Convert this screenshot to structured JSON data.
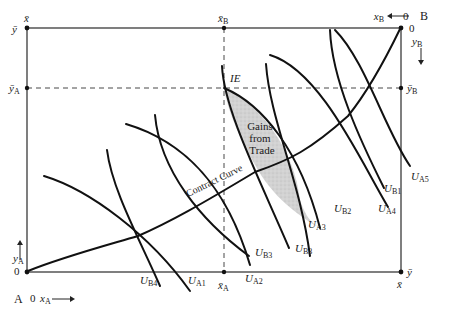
{
  "diagram": {
    "type": "Edgeworth box",
    "origin_A": {
      "label": "A",
      "zero_x": "0",
      "zero_y": "0",
      "x_axis": "x",
      "x_sub": "A",
      "y_axis": "y",
      "y_sub": "A"
    },
    "origin_B": {
      "label": "B",
      "zero_x": "0",
      "zero_y": "0",
      "x_axis": "x",
      "x_sub": "B",
      "y_axis": "y",
      "y_sub": "B"
    },
    "corner_labels": {
      "top_left_x": "x̄",
      "top_left_y": "ȳ",
      "bottom_right_x": "x̄",
      "bottom_right_y": "ȳ"
    },
    "endowment_markers": {
      "x_bar_A": {
        "base": "x̄",
        "sub": "A"
      },
      "x_bar_B": {
        "base": "x̄",
        "sub": "B"
      },
      "y_bar_A": {
        "base": "ȳ",
        "sub": "A"
      },
      "y_bar_B": {
        "base": "ȳ",
        "sub": "B"
      }
    },
    "initial_endowment_label": "IE",
    "gains_region_label": [
      "Gains",
      "from",
      "Trade"
    ],
    "contract_curve_label": "Contract Curve",
    "indifference_curves_A": [
      {
        "base": "U",
        "sub": "A1"
      },
      {
        "base": "U",
        "sub": "A2"
      },
      {
        "base": "U",
        "sub": "A3"
      },
      {
        "base": "U",
        "sub": "A4"
      },
      {
        "base": "U",
        "sub": "A5"
      }
    ],
    "indifference_curves_B": [
      {
        "base": "U",
        "sub": "B1"
      },
      {
        "base": "U",
        "sub": "B2"
      },
      {
        "base": "U",
        "sub": "B3"
      },
      {
        "base": "U",
        "sub": "B3"
      },
      {
        "base": "U",
        "sub": "B4"
      }
    ],
    "colors": {
      "ink": "#111111",
      "shading": "#c8c8c8"
    }
  }
}
